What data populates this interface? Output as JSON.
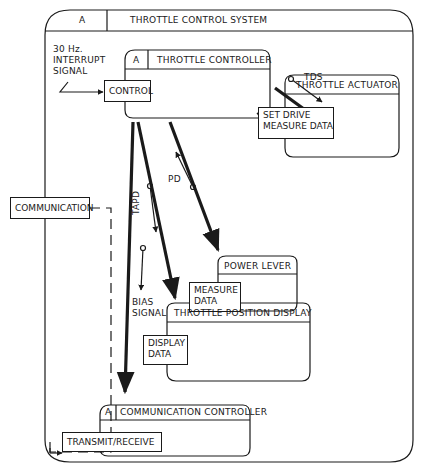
{
  "system": {
    "tag": "A",
    "title": "THROTTLE CONTROL SYSTEM"
  },
  "interrupt_label": [
    "30 Hz.",
    "INTERRUPT",
    "SIGNAL"
  ],
  "throttle_controller": {
    "tag": "A",
    "title": "THROTTLE CONTROLLER",
    "port": "CONTROL"
  },
  "throttle_actuator": {
    "title": "THROTTLE ACTUATOR",
    "port": [
      "SET DRIVE",
      "MEASURE DATA"
    ]
  },
  "power_lever": {
    "title": "POWER LEVER",
    "port": [
      "MEASURE",
      "DATA"
    ]
  },
  "throttle_position_display": {
    "title": "THROTTLE POSITION DISPLAY",
    "port": [
      "DISPLAY",
      "DATA"
    ]
  },
  "communication_controller": {
    "tag": "A",
    "title": "COMMUNICATION CONTROLLER",
    "port": "TRANSMIT/RECEIVE"
  },
  "communication_box": "COMMUNICATION",
  "signals": {
    "tds": "TDS",
    "ts": "TS",
    "pd": "PD",
    "tapd": "TAPD",
    "bias": [
      "BIAS",
      "SIGNAL"
    ]
  }
}
